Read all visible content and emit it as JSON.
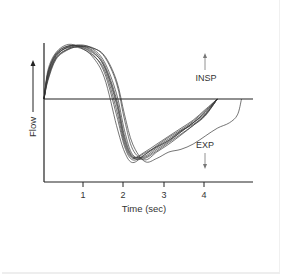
{
  "chart_data": {
    "type": "line",
    "title": "",
    "xlabel": "Time (sec)",
    "ylabel": "Flow",
    "xlim": [
      0,
      5.2
    ],
    "ylim": [
      -1.57,
      1.85
    ],
    "x_ticks": [
      1,
      2,
      3,
      4
    ],
    "x_tick_labels": [
      "1",
      "2",
      "3",
      "4"
    ],
    "y_ticks": [],
    "zero_line": true,
    "grid": false,
    "legend": null,
    "annotations": [
      {
        "text": "INSP",
        "direction": "up",
        "x": 4.0,
        "y": 0.45
      },
      {
        "text": "EXP",
        "direction": "down",
        "x": 4.0,
        "y": -1.0
      }
    ],
    "series": [
      {
        "name": "breath 1",
        "x": [
          0,
          0.1,
          0.3,
          0.6,
          0.9,
          1.2,
          1.5,
          1.8,
          2.0,
          2.2,
          2.5,
          2.8,
          3.1,
          3.4,
          3.7,
          4.0,
          4.3
        ],
        "y": [
          0,
          0.45,
          0.82,
          0.98,
          1.0,
          0.9,
          0.6,
          -0.1,
          -0.8,
          -1.1,
          -1.0,
          -0.85,
          -0.7,
          -0.55,
          -0.4,
          -0.2,
          0
        ]
      },
      {
        "name": "breath 2",
        "x": [
          0,
          0.1,
          0.3,
          0.6,
          0.9,
          1.2,
          1.5,
          1.8,
          2.0,
          2.2,
          2.5,
          2.8,
          3.1,
          3.4,
          3.7,
          4.0,
          4.3
        ],
        "y": [
          0,
          0.5,
          0.85,
          1.0,
          0.98,
          0.85,
          0.5,
          -0.3,
          -0.9,
          -1.15,
          -1.05,
          -0.9,
          -0.75,
          -0.6,
          -0.45,
          -0.25,
          0
        ]
      },
      {
        "name": "breath 3",
        "x": [
          0,
          0.1,
          0.3,
          0.6,
          0.9,
          1.2,
          1.5,
          1.8,
          2.0,
          2.2,
          2.5,
          2.8,
          3.1,
          3.4,
          3.7,
          4.0,
          4.3
        ],
        "y": [
          0,
          0.4,
          0.78,
          0.95,
          1.02,
          0.95,
          0.7,
          0.1,
          -0.6,
          -1.05,
          -1.1,
          -0.95,
          -0.8,
          -0.62,
          -0.45,
          -0.25,
          0
        ]
      },
      {
        "name": "breath 4",
        "x": [
          0,
          0.1,
          0.3,
          0.6,
          0.9,
          1.2,
          1.5,
          1.8,
          2.0,
          2.2,
          2.5,
          2.8,
          3.1,
          3.4,
          3.7,
          4.0,
          4.3
        ],
        "y": [
          0,
          0.55,
          0.88,
          1.03,
          0.97,
          0.8,
          0.4,
          -0.5,
          -1.0,
          -1.2,
          -1.05,
          -0.88,
          -0.72,
          -0.58,
          -0.42,
          -0.22,
          0
        ]
      },
      {
        "name": "breath 5",
        "x": [
          0,
          0.1,
          0.3,
          0.6,
          0.9,
          1.2,
          1.5,
          1.8,
          2.0,
          2.2,
          2.5,
          2.8,
          3.1,
          3.4,
          3.7,
          4.0,
          4.3
        ],
        "y": [
          0,
          0.35,
          0.75,
          0.93,
          1.0,
          0.97,
          0.8,
          0.3,
          -0.4,
          -0.95,
          -1.15,
          -1.0,
          -0.85,
          -0.68,
          -0.5,
          -0.3,
          0
        ]
      },
      {
        "name": "breath 6",
        "x": [
          0,
          0.1,
          0.3,
          0.6,
          0.9,
          1.2,
          1.5,
          1.8,
          2.0,
          2.2,
          2.5,
          2.8,
          3.1,
          3.4,
          3.7,
          4.0,
          4.3
        ],
        "y": [
          0,
          0.48,
          0.83,
          0.97,
          0.96,
          0.83,
          0.55,
          -0.2,
          -0.85,
          -1.12,
          -1.02,
          -0.9,
          -0.78,
          -0.6,
          -0.48,
          -0.3,
          0
        ]
      },
      {
        "name": "breath 7",
        "x": [
          0,
          0.1,
          0.3,
          0.6,
          0.9,
          1.2,
          1.5,
          1.8,
          2.0,
          2.2,
          2.5,
          2.8,
          3.1,
          3.4,
          3.7,
          4.0,
          4.3
        ],
        "y": [
          0,
          0.42,
          0.8,
          0.99,
          1.01,
          0.92,
          0.65,
          0.0,
          -0.7,
          -1.08,
          -1.08,
          -0.92,
          -0.78,
          -0.62,
          -0.45,
          -0.28,
          0
        ]
      },
      {
        "name": "breath 8",
        "x": [
          0,
          0.1,
          0.3,
          0.6,
          0.9,
          1.2,
          1.5,
          1.8,
          2.0,
          2.2,
          2.5,
          2.8,
          3.1,
          3.4,
          3.7,
          4.0,
          4.3
        ],
        "y": [
          0,
          0.5,
          0.86,
          1.0,
          0.99,
          0.88,
          0.62,
          -0.05,
          -0.75,
          -1.1,
          -1.12,
          -0.98,
          -0.82,
          -0.66,
          -0.5,
          -0.32,
          0
        ]
      },
      {
        "name": "breath 9 (prolonged expiration)",
        "x": [
          0,
          0.1,
          0.3,
          0.6,
          0.9,
          1.2,
          1.5,
          1.8,
          2.0,
          2.2,
          2.5,
          2.8,
          3.1,
          3.4,
          3.7,
          4.0,
          4.3,
          4.6,
          4.8,
          4.9
        ],
        "y": [
          0,
          0.38,
          0.77,
          0.94,
          0.99,
          0.96,
          0.82,
          0.35,
          -0.3,
          -0.85,
          -1.18,
          -1.12,
          -1.0,
          -0.95,
          -0.85,
          -0.7,
          -0.55,
          -0.45,
          -0.3,
          0
        ]
      }
    ]
  },
  "labels": {
    "y_axis": "Flow",
    "x_axis": "Time (sec)",
    "insp": "INSP",
    "exp": "EXP",
    "ticks": [
      "1",
      "2",
      "3",
      "4"
    ]
  }
}
